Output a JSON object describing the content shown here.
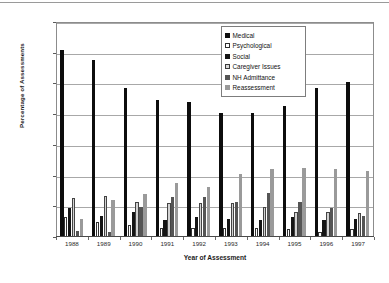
{
  "chart_data": {
    "type": "bar",
    "title": "",
    "xlabel": "Year of Assessment",
    "ylabel": "Percentage of Assessments",
    "ylim": [
      0,
      70
    ],
    "yticks": [
      0,
      10,
      20,
      30,
      40,
      50,
      60,
      70
    ],
    "grid": true,
    "legend_position": "top-right",
    "categories": [
      "1988",
      "1989",
      "1990",
      "1991",
      "1992",
      "1993",
      "1994",
      "1995",
      "1996",
      "1997"
    ],
    "series": [
      {
        "name": "Medical",
        "color": "#0d0d0d",
        "values": [
          61,
          57.5,
          48.5,
          44.5,
          44,
          40.5,
          40.5,
          42.5,
          48.5,
          50.5
        ]
      },
      {
        "name": "Psychological",
        "color": "#ffffff",
        "values": [
          6.5,
          5,
          4,
          3,
          3,
          3,
          3,
          2.5,
          1.5,
          2.5
        ]
      },
      {
        "name": "Social",
        "color": "#141414",
        "values": [
          9.5,
          7,
          8,
          5.5,
          6.5,
          6,
          5.5,
          6.5,
          5.5,
          6
        ]
      },
      {
        "name": "Caregiver Issues",
        "color": "#d2d2d2",
        "values": [
          12.8,
          13.3,
          11.3,
          11,
          11,
          11,
          9.8,
          8,
          8.3,
          7.8
        ]
      },
      {
        "name": "NH Admittance",
        "color": "#555555",
        "values": [
          2,
          1.5,
          9.8,
          13,
          13,
          11.3,
          14.3,
          11.5,
          9.3,
          7
        ]
      },
      {
        "name": "Reassessment",
        "color": "#9a9a9a",
        "values": [
          6,
          12,
          14,
          17.5,
          16.3,
          20.5,
          22,
          22.5,
          22.3,
          21.5
        ]
      }
    ]
  },
  "legend": {
    "items": [
      {
        "label": "Medical"
      },
      {
        "label": "Psychological"
      },
      {
        "label": "Social"
      },
      {
        "label": "Caregiver Issues"
      },
      {
        "label": "NH Admittance"
      },
      {
        "label": "Reassessment"
      }
    ]
  }
}
